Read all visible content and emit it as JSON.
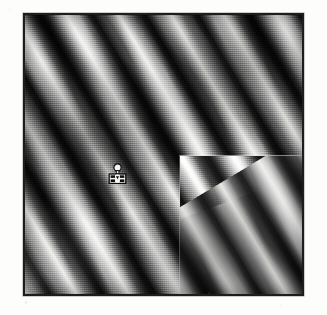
{
  "figure": {
    "kind": "grayscale-fringe-micrograph",
    "background_color": "#fdfdfc",
    "border_color": "#1d1d1d",
    "frame": {
      "x": 23,
      "y": 13,
      "width": 281,
      "height": 283
    },
    "tonal_range": {
      "darkest": "#0a0a0a",
      "lightest": "#f2f2f0",
      "midtone": "#6d6d6d"
    },
    "fringes": {
      "orientation": "upper-left to lower-right diagonal",
      "angle_deg": -31,
      "approx_band_count": 9,
      "band_period_px": 45
    },
    "inset": {
      "label": "rescanned-subregion",
      "x": 154,
      "y": 140,
      "width": 127,
      "height": 143,
      "seam_visible": true,
      "seam_color": "#e8e8e6"
    },
    "marker": {
      "name": "position-marker",
      "icon": "pin-marker-icon",
      "x": 83,
      "y": 148,
      "width": 19,
      "height": 24,
      "fill": "#f4f4f2",
      "stroke": "#0d0d0d"
    }
  }
}
